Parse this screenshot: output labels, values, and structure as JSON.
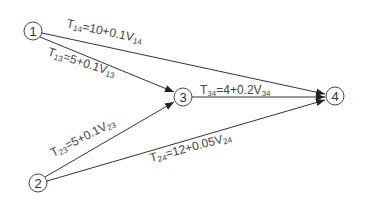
{
  "diagram": {
    "type": "network-graph",
    "nodes": [
      {
        "id": "1",
        "label": "1",
        "x": 33,
        "y": 31
      },
      {
        "id": "2",
        "label": "2",
        "x": 38,
        "y": 183
      },
      {
        "id": "3",
        "label": "3",
        "x": 183,
        "y": 97
      },
      {
        "id": "4",
        "label": "4",
        "x": 335,
        "y": 96
      }
    ],
    "edges": [
      {
        "from": "1",
        "to": "4",
        "T": "T",
        "T_sub": "14",
        "expr": "=10+0.1V",
        "V_sub": "14"
      },
      {
        "from": "1",
        "to": "3",
        "T": "T",
        "T_sub": "13",
        "expr": "=5+0.1V",
        "V_sub": "13"
      },
      {
        "from": "3",
        "to": "4",
        "T": "T",
        "T_sub": "34",
        "expr": "=4+0.2V",
        "V_sub": "34"
      },
      {
        "from": "2",
        "to": "3",
        "T": "T",
        "T_sub": "23",
        "expr": "=5+0.1V",
        "V_sub": "23"
      },
      {
        "from": "2",
        "to": "4",
        "T": "T",
        "T_sub": "24",
        "expr": "=12+0.05V",
        "V_sub": "24"
      }
    ],
    "colors": {
      "line": "#333333",
      "text": "#444444",
      "background": "#ffffff"
    }
  }
}
